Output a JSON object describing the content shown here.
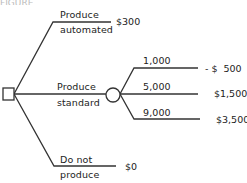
{
  "header": {
    "partial_text": "FIGURE"
  },
  "tree": {
    "decision_node": {
      "shape": "square"
    },
    "chance_node": {
      "shape": "circle"
    },
    "branches": [
      {
        "label_line1": "Produce",
        "label_line2": "automated",
        "payoff": "$300"
      },
      {
        "label_line1": "Produce",
        "label_line2": "standard",
        "payoff": null,
        "outcomes": [
          {
            "label": "1,000",
            "payoff": "- $  500"
          },
          {
            "label": "5,000",
            "payoff": "$1,500"
          },
          {
            "label": "9,000",
            "payoff": "$3,500"
          }
        ]
      },
      {
        "label_line1": "Do not",
        "label_line2": "produce",
        "payoff": "$0"
      }
    ]
  },
  "colors": {
    "line": "#333333",
    "text": "#222222",
    "background": "#ffffff"
  }
}
